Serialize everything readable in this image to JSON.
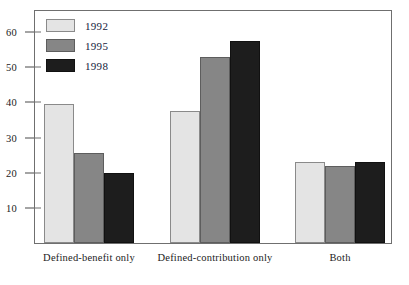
{
  "chart_data": {
    "type": "bar",
    "title": "",
    "subtitle": "",
    "xlabel": "",
    "ylabel": "",
    "categories": [
      "Defined-benefit only",
      "Defined-contribution only",
      "Both"
    ],
    "series": [
      {
        "name": "1992",
        "color": "#e4e4e4",
        "values": [
          39.5,
          37.5,
          23
        ]
      },
      {
        "name": "1995",
        "color": "#868686",
        "values": [
          25.5,
          53,
          22
        ]
      },
      {
        "name": "1998",
        "color": "#1d1d1d",
        "values": [
          20,
          57.5,
          23
        ]
      }
    ],
    "ylim": [
      0,
      66
    ],
    "yticks": [
      10,
      20,
      30,
      40,
      50,
      60
    ],
    "ytick_labels": [
      "10",
      "20",
      "30",
      "40",
      "50",
      "60"
    ],
    "grid": false,
    "legend_position": "top-left",
    "legend_entries": [
      "1992",
      "1995",
      "1998"
    ],
    "annotations": []
  }
}
